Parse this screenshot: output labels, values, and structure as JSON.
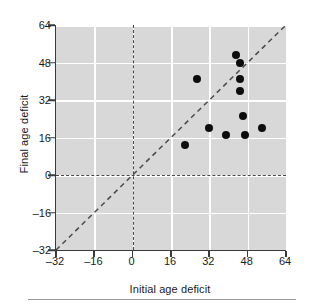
{
  "chart_data": {
    "type": "scatter",
    "title": "",
    "xlabel": "Initial age deficit",
    "ylabel": "Final age deficit",
    "xlim": [
      -32,
      64
    ],
    "ylim": [
      -32,
      64
    ],
    "xticks": [
      -32,
      -16,
      0,
      16,
      32,
      48,
      64
    ],
    "yticks": [
      -32,
      -16,
      0,
      16,
      32,
      48,
      64
    ],
    "xtick_labels": [
      "–32",
      "–16",
      "0",
      "16",
      "32",
      "48",
      "64"
    ],
    "ytick_labels": [
      "–32",
      "–16",
      "0",
      "16",
      "32",
      "48",
      "64"
    ],
    "grid": true,
    "legend": null,
    "points": [
      {
        "x": 22,
        "y": 13
      },
      {
        "x": 27,
        "y": 41
      },
      {
        "x": 32,
        "y": 20
      },
      {
        "x": 39,
        "y": 17
      },
      {
        "x": 43,
        "y": 51
      },
      {
        "x": 45,
        "y": 48
      },
      {
        "x": 45,
        "y": 41
      },
      {
        "x": 45,
        "y": 36
      },
      {
        "x": 46,
        "y": 25
      },
      {
        "x": 47,
        "y": 17
      },
      {
        "x": 54,
        "y": 20
      }
    ],
    "reference_lines": [
      {
        "name": "identity-line",
        "type": "diagonal",
        "from": [
          -32,
          -32
        ],
        "to": [
          64,
          64
        ],
        "style": "dashed"
      },
      {
        "name": "zero-horizontal",
        "type": "horizontal",
        "value": 0,
        "style": "dashed"
      },
      {
        "name": "zero-vertical",
        "type": "vertical",
        "value": 0,
        "style": "dashed"
      }
    ],
    "colors": {
      "panel_background": "#d8d8d8",
      "gridline": "#ffffff",
      "marker": "#0d0d0d",
      "axis": "#3a3a3a",
      "reference_line": "#4a4a4a",
      "text": "#1a1a1a"
    }
  }
}
